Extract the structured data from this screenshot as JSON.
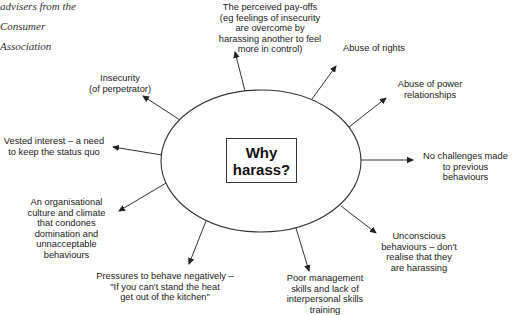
{
  "sidenote": {
    "lines": [
      "advisers from the",
      "Consumer",
      "Association"
    ]
  },
  "center": {
    "title": "Why\nharass?"
  },
  "causes": [
    {
      "id": "payoffs",
      "text": "The perceived pay-offs\n(eg feelings of insecurity\nare overcome by\nharassing another to feel\nmore in control)"
    },
    {
      "id": "abuse-rights",
      "text": "Abuse of rights"
    },
    {
      "id": "abuse-power",
      "text": "Abuse of power\nrelationships"
    },
    {
      "id": "no-challenges",
      "text": "No challenges made\nto previous\nbehaviours"
    },
    {
      "id": "unconscious",
      "text": "Unconscious\nbehaviours – don't\nrealise that they\nare harassing"
    },
    {
      "id": "poor-management",
      "text": "Poor management\nskills and lack of\ninterpersonal skills\ntraining"
    },
    {
      "id": "pressures",
      "text": "Pressures to behave negatively –\n\"If you can't stand the heat\nget out of the kitchen\""
    },
    {
      "id": "culture",
      "text": "An organisational\nculture and climate\nthat condones\ndomination and\nunnacceptable\nbehaviours"
    },
    {
      "id": "vested-interest",
      "text": "Vested interest – a need\nto keep the status quo"
    },
    {
      "id": "insecurity",
      "text": "Insecurity\n(of perpetrator)"
    }
  ],
  "colors": {
    "line": "#333333",
    "text": "#1a1a1a",
    "background": "#ffffff"
  }
}
